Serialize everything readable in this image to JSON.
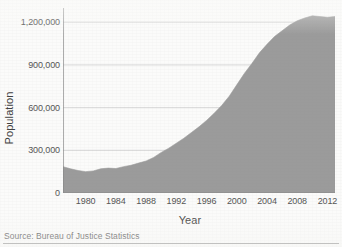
{
  "chart_data": {
    "type": "area",
    "title": "",
    "xlabel": "Year",
    "ylabel": "Population",
    "xlim": [
      1977,
      2013
    ],
    "ylim": [
      0,
      1300000
    ],
    "grid": true,
    "legend": false,
    "source": "Source: Bureau of Justice Statistics",
    "series_color": "#9b9b9b",
    "grid_color": "#d8d8d8",
    "axis_color": "#8a8a8a",
    "y_ticks": [
      {
        "value": 0,
        "label": "0"
      },
      {
        "value": 300000,
        "label": "300,000"
      },
      {
        "value": 600000,
        "label": "600,000"
      },
      {
        "value": 900000,
        "label": "900,000"
      },
      {
        "value": 1200000,
        "label": "1,200,000"
      }
    ],
    "x_ticks": [
      {
        "value": 1980,
        "label": "1980"
      },
      {
        "value": 1984,
        "label": "1984"
      },
      {
        "value": 1988,
        "label": "1988"
      },
      {
        "value": 1992,
        "label": "1992"
      },
      {
        "value": 1996,
        "label": "1996"
      },
      {
        "value": 2000,
        "label": "2000"
      },
      {
        "value": 2004,
        "label": "2004"
      },
      {
        "value": 2008,
        "label": "2008"
      },
      {
        "value": 2012,
        "label": "2012"
      }
    ],
    "x": [
      1977,
      1978,
      1979,
      1980,
      1981,
      1982,
      1983,
      1984,
      1985,
      1986,
      1987,
      1988,
      1989,
      1990,
      1991,
      1992,
      1993,
      1994,
      1995,
      1996,
      1997,
      1998,
      1999,
      2000,
      2001,
      2002,
      2003,
      2004,
      2005,
      2006,
      2007,
      2008,
      2009,
      2010,
      2011,
      2012,
      2013
    ],
    "values": [
      185000,
      170000,
      158000,
      150000,
      155000,
      170000,
      175000,
      172000,
      185000,
      195000,
      210000,
      225000,
      250000,
      285000,
      315000,
      350000,
      385000,
      425000,
      465000,
      510000,
      560000,
      615000,
      680000,
      760000,
      840000,
      910000,
      985000,
      1045000,
      1100000,
      1140000,
      1180000,
      1210000,
      1230000,
      1245000,
      1240000,
      1235000,
      1240000
    ]
  },
  "figure": {
    "axis_titles": {
      "y": "Population",
      "x": "Year"
    },
    "source_note": "Source: Bureau of Justice Statistics"
  }
}
